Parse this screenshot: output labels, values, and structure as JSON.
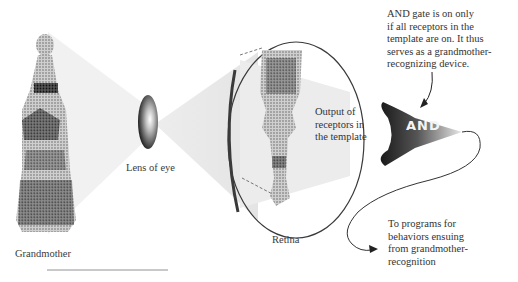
{
  "figure": {
    "labels": {
      "grandmother": "Grandmother",
      "lens": "Lens of eye",
      "retina": "Retina",
      "output": "Output of\nreceptors in\nthe template",
      "gate": "AND"
    },
    "annotations": {
      "gate_note": "AND gate is on only\nif all receptors in the\ntemplate are on. It thus\nserves as a grandmother-\nrecognizing device.",
      "output_note": "To programs for\nbehaviors ensuing\nfrom grandmother-\nrecognition"
    },
    "colors": {
      "light_beam": "#ececec",
      "lens_dark": "#2a2a2a",
      "gate_dark": "#1e1e1e",
      "ink": "#333333"
    }
  }
}
